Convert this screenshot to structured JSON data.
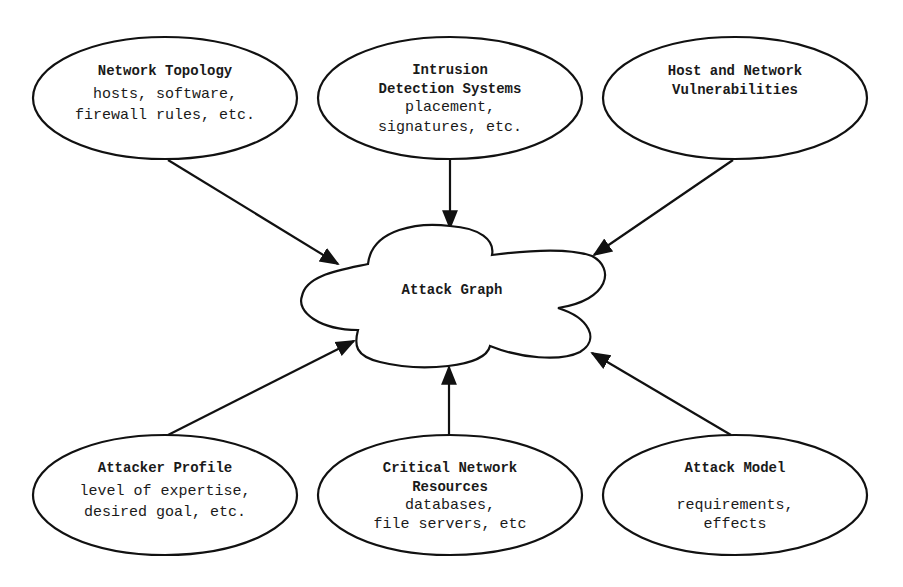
{
  "diagram": {
    "center": {
      "label": "Attack Graph"
    },
    "nodes": [
      {
        "id": "network-topology",
        "title": [
          "Network Topology"
        ],
        "details": [
          "hosts, software,",
          "firewall rules, etc."
        ]
      },
      {
        "id": "intrusion-detection-systems",
        "title": [
          "Intrusion",
          "Detection Systems"
        ],
        "details": [
          "placement,",
          "signatures, etc."
        ]
      },
      {
        "id": "host-network-vulnerabilities",
        "title": [
          "Host and Network",
          "Vulnerabilities"
        ],
        "details": []
      },
      {
        "id": "attacker-profile",
        "title": [
          "Attacker Profile"
        ],
        "details": [
          "level of expertise,",
          "desired goal, etc."
        ]
      },
      {
        "id": "critical-network-resources",
        "title": [
          "Critical Network",
          "Resources"
        ],
        "details": [
          "databases,",
          "file servers, etc"
        ]
      },
      {
        "id": "attack-model",
        "title": [
          "Attack Model"
        ],
        "details": [
          "",
          "requirements,",
          "effects"
        ]
      }
    ],
    "edges": [
      {
        "from": "network-topology",
        "to": "attack-graph"
      },
      {
        "from": "intrusion-detection-systems",
        "to": "attack-graph"
      },
      {
        "from": "host-network-vulnerabilities",
        "to": "attack-graph"
      },
      {
        "from": "attacker-profile",
        "to": "attack-graph"
      },
      {
        "from": "critical-network-resources",
        "to": "attack-graph"
      },
      {
        "from": "attack-model",
        "to": "attack-graph"
      }
    ]
  }
}
